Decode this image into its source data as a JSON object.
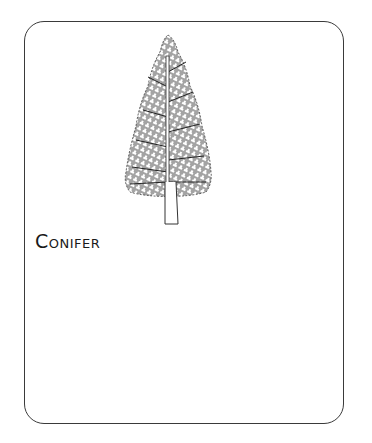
{
  "card": {
    "illustration": "conifer-tree",
    "title": "Conifer"
  },
  "colors": {
    "border": "#3a3a3a",
    "ink": "#1a1a1a",
    "background": "#ffffff"
  }
}
